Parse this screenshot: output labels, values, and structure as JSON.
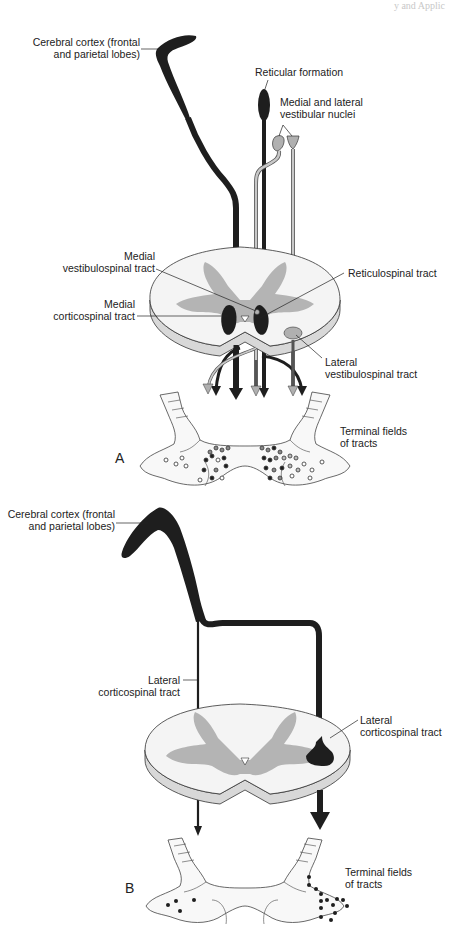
{
  "figure": {
    "header_fragment": "y and Applic",
    "panel_a": {
      "letter": "A",
      "labels": {
        "cortex_line1": "Cerebral cortex (frontal",
        "cortex_line2": "and parietal lobes)",
        "reticular_formation": "Reticular formation",
        "vestibular_nuclei_line1": "Medial and lateral",
        "vestibular_nuclei_line2": "vestibular nuclei",
        "medial_vestibulospinal_line1": "Medial",
        "medial_vestibulospinal_line2": "vestibulospinal tract",
        "medial_corticospinal_line1": "Medial",
        "medial_corticospinal_line2": "corticospinal tract",
        "reticulospinal": "Reticulospinal tract",
        "lateral_vestibulospinal_line1": "Lateral",
        "lateral_vestibulospinal_line2": "vestibulospinal tract",
        "terminal_fields_line1": "Terminal fields",
        "terminal_fields_line2": "of tracts"
      }
    },
    "panel_b": {
      "letter": "B",
      "labels": {
        "cortex_line1": "Cerebral cortex (frontal",
        "cortex_line2": "and parietal lobes)",
        "lateral_corticospinal_left_line1": "Lateral",
        "lateral_corticospinal_left_line2": "corticospinal tract",
        "lateral_corticospinal_right_line1": "Lateral",
        "lateral_corticospinal_right_line2": "corticospinal tract",
        "terminal_fields_line1": "Terminal fields",
        "terminal_fields_line2": "of tracts"
      }
    },
    "colors": {
      "tract_dark": "#1e1e1e",
      "tract_gray": "#a8a8a8",
      "gray_matter": "#b4b4b4",
      "white_matter": "#f4f4f4",
      "cord_edge": "#d8d8d8",
      "outline": "#333333"
    }
  }
}
